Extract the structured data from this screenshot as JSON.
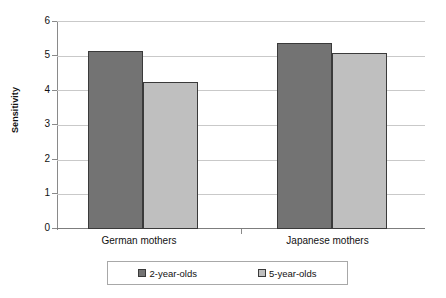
{
  "chart_data": {
    "type": "bar",
    "title": "",
    "subtitle": "",
    "xlabel": "",
    "ylabel": "Sensitivity",
    "categories": [
      "German mothers",
      "Japanese mothers"
    ],
    "series": [
      {
        "name": "2-year-olds",
        "values": [
          5.15,
          5.4
        ],
        "color": "#737373"
      },
      {
        "name": "5-year-olds",
        "values": [
          4.25,
          5.1
        ],
        "color": "#bfbfbf"
      }
    ],
    "ylim": [
      0,
      6
    ],
    "ytick_labels": [
      "6",
      "5",
      "4",
      "3",
      "2",
      "1",
      "0"
    ],
    "ytick_values": [
      6,
      5,
      4,
      3,
      2,
      1,
      0
    ],
    "grid": true,
    "grid_axis": "y",
    "legend_position": "bottom",
    "legend_entries": [
      "2-year-olds",
      "5-year-olds"
    ],
    "bar_border_color": "#3a3a3a",
    "gridline_color": "#c9c9c9",
    "axis_color": "#8a8a8a",
    "background_color": "#ffffff"
  }
}
